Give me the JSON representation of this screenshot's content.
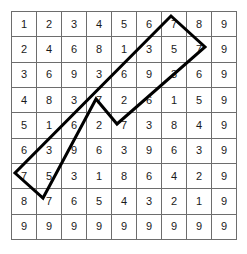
{
  "figure": {
    "name": "digital-root-multiplication-table-with-highlight-band",
    "grid_line_color": "#6d6d6d",
    "digit_color": "#1a1a1a",
    "highlight_color": "#000000",
    "background_color": "#ffffff",
    "rows": 9,
    "columns": 9
  },
  "table": {
    "rows": [
      [
        "1",
        "2",
        "3",
        "4",
        "5",
        "6",
        "7",
        "8",
        "9"
      ],
      [
        "2",
        "4",
        "6",
        "8",
        "1",
        "3",
        "5",
        "7",
        "9"
      ],
      [
        "3",
        "6",
        "9",
        "3",
        "6",
        "9",
        "3",
        "6",
        "9"
      ],
      [
        "4",
        "8",
        "3",
        "7",
        "2",
        "6",
        "1",
        "5",
        "9"
      ],
      [
        "5",
        "1",
        "6",
        "2",
        "7",
        "3",
        "8",
        "4",
        "9"
      ],
      [
        "6",
        "3",
        "9",
        "6",
        "3",
        "9",
        "6",
        "3",
        "9"
      ],
      [
        "7",
        "5",
        "3",
        "1",
        "8",
        "6",
        "4",
        "2",
        "9"
      ],
      [
        "8",
        "7",
        "6",
        "5",
        "4",
        "3",
        "2",
        "1",
        "9"
      ],
      [
        "9",
        "9",
        "9",
        "9",
        "9",
        "9",
        "9",
        "9",
        "9"
      ]
    ]
  },
  "chart_data": {
    "type": "table",
    "title": "",
    "xlabel": "",
    "ylabel": "",
    "categories": [
      "1",
      "2",
      "3",
      "4",
      "5",
      "6",
      "7",
      "8",
      "9"
    ],
    "series": [
      {
        "name": "1",
        "values": [
          1,
          2,
          3,
          4,
          5,
          6,
          7,
          8,
          9
        ]
      },
      {
        "name": "2",
        "values": [
          2,
          4,
          6,
          8,
          1,
          3,
          5,
          7,
          9
        ]
      },
      {
        "name": "3",
        "values": [
          3,
          6,
          9,
          3,
          6,
          9,
          3,
          6,
          9
        ]
      },
      {
        "name": "4",
        "values": [
          4,
          8,
          3,
          7,
          2,
          6,
          1,
          5,
          9
        ]
      },
      {
        "name": "5",
        "values": [
          5,
          1,
          6,
          2,
          7,
          3,
          8,
          4,
          9
        ]
      },
      {
        "name": "6",
        "values": [
          6,
          3,
          9,
          6,
          3,
          9,
          6,
          3,
          9
        ]
      },
      {
        "name": "7",
        "values": [
          7,
          5,
          3,
          1,
          8,
          6,
          4,
          2,
          9
        ]
      },
      {
        "name": "8",
        "values": [
          8,
          7,
          6,
          5,
          4,
          3,
          2,
          1,
          9
        ]
      },
      {
        "name": "9",
        "values": [
          9,
          9,
          9,
          9,
          9,
          9,
          9,
          9,
          9
        ]
      }
    ],
    "annotations": [
      {
        "name": "highlight-band",
        "shape": "polygon",
        "stroke": "#000000",
        "stroke_width": 3,
        "points": "171,16 205,47 117,124 96,99 43,198 15,173"
      }
    ]
  },
  "overlay": {
    "band": {
      "points": "171,16 205,47 117,124 96,99 43,198 15,173",
      "stroke": "#000000",
      "stroke_width": "3"
    }
  }
}
